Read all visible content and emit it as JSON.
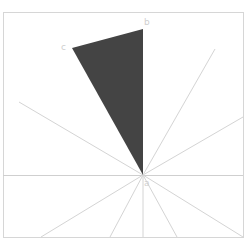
{
  "diagram": {
    "title": "",
    "frame": {
      "x": 3,
      "y": 12,
      "width": 240,
      "height": 225,
      "color": "#d6d6d6"
    },
    "center": {
      "x": 143,
      "y": 175
    },
    "horizontal_line": {
      "y": 175,
      "x1": 3,
      "x2": 243
    },
    "rays": [
      {
        "x": 215,
        "y": 49
      },
      {
        "x": 243,
        "y": 117
      },
      {
        "x": 19,
        "y": 102
      },
      {
        "x": 41,
        "y": 237
      },
      {
        "x": 110,
        "y": 237
      },
      {
        "x": 143,
        "y": 237
      },
      {
        "x": 177,
        "y": 237
      },
      {
        "x": 243,
        "y": 237
      }
    ],
    "ray_color": "#d4d4d4",
    "triangle": {
      "fill": "#444444",
      "vertices": [
        {
          "name": "a",
          "x": 143,
          "y": 175
        },
        {
          "name": "b",
          "x": 143,
          "y": 29
        },
        {
          "name": "c",
          "x": 72,
          "y": 48
        }
      ]
    },
    "labels": [
      {
        "text": "a",
        "x": 144,
        "y": 186
      },
      {
        "text": "b",
        "x": 144,
        "y": 25
      },
      {
        "text": "c",
        "x": 61,
        "y": 50
      }
    ],
    "label_color": "#cfcfcf"
  }
}
